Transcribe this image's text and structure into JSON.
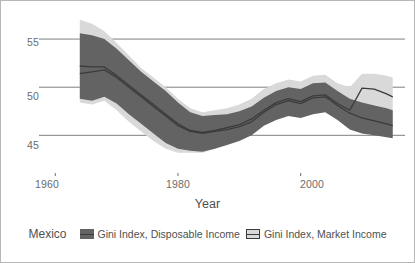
{
  "chart_data": {
    "type": "area",
    "title": "",
    "subtitle": "",
    "xlabel": "Year",
    "ylabel": "",
    "xlim": [
      1958,
      2017
    ],
    "ylim": [
      41.5,
      57.5
    ],
    "xticks": [
      1960,
      1980,
      2000
    ],
    "xtick_labels": [
      "1960",
      "1980",
      "2000"
    ],
    "yticks": [
      45,
      50,
      55
    ],
    "ytick_labels": [
      "45",
      "50",
      "55"
    ],
    "grid": "horizontal",
    "legend_position": "bottom",
    "group_label": "Mexico",
    "colors": {
      "disposable_band": "#636363",
      "disposable_line": "#3b3b3b",
      "market_band": "#d9d9d9",
      "market_line": "#3b3b3b",
      "gridline": "#6f7173",
      "border": "#b5b7b9",
      "text": "#4e5052",
      "tick_text": "#6a6c6e",
      "background": "#ffffff"
    },
    "x": [
      1964,
      1966,
      1968,
      1970,
      1972,
      1974,
      1976,
      1978,
      1980,
      1982,
      1984,
      1986,
      1988,
      1990,
      1992,
      1994,
      1996,
      1998,
      2000,
      2002,
      2004,
      2006,
      2008,
      2010,
      2012,
      2014,
      2015
    ],
    "series": [
      {
        "name": "Gini Index, Disposable Income",
        "style": "filled-band",
        "values": [
          51.4,
          51.6,
          51.8,
          51.0,
          50.0,
          49.0,
          48.0,
          47.0,
          46.0,
          45.4,
          45.2,
          45.4,
          45.6,
          45.9,
          46.4,
          47.4,
          48.2,
          48.6,
          48.3,
          48.9,
          49.0,
          48.1,
          47.3,
          46.8,
          46.5,
          46.2,
          46.0
        ],
        "lower": [
          48.8,
          48.6,
          49.0,
          48.3,
          47.2,
          46.2,
          45.2,
          44.2,
          43.6,
          43.4,
          43.3,
          43.6,
          44.0,
          44.4,
          45.0,
          46.0,
          46.6,
          47.0,
          46.8,
          47.2,
          47.4,
          46.6,
          45.6,
          45.2,
          45.0,
          44.8,
          44.7
        ],
        "upper": [
          55.6,
          55.4,
          55.0,
          54.0,
          52.8,
          51.6,
          50.6,
          49.6,
          48.4,
          47.4,
          47.0,
          47.1,
          47.2,
          47.5,
          48.0,
          48.9,
          49.6,
          50.0,
          49.8,
          50.4,
          50.5,
          49.6,
          48.8,
          48.4,
          48.1,
          47.8,
          47.6
        ]
      },
      {
        "name": "Gini Index, Market Income",
        "style": "outlined-band",
        "values": [
          52.2,
          52.1,
          52.1,
          51.2,
          50.2,
          49.2,
          48.2,
          47.2,
          46.2,
          45.5,
          45.3,
          45.5,
          45.8,
          46.1,
          46.7,
          47.6,
          48.4,
          48.8,
          48.5,
          49.1,
          49.2,
          48.3,
          47.6,
          49.9,
          49.8,
          49.3,
          49.0
        ],
        "lower": [
          48.4,
          48.2,
          48.6,
          47.6,
          46.4,
          45.4,
          44.4,
          43.6,
          43.2,
          43.2,
          43.2,
          43.6,
          44.2,
          44.8,
          45.6,
          46.6,
          47.2,
          47.5,
          47.2,
          47.6,
          47.8,
          46.9,
          46.0,
          47.4,
          47.2,
          46.6,
          45.2
        ],
        "upper": [
          57.0,
          56.6,
          55.8,
          54.6,
          53.3,
          52.0,
          51.0,
          50.0,
          48.8,
          47.8,
          47.4,
          47.6,
          47.8,
          48.2,
          48.8,
          49.8,
          50.4,
          50.8,
          50.6,
          51.2,
          51.3,
          50.4,
          50.0,
          51.4,
          51.4,
          51.2,
          51.0
        ]
      }
    ]
  }
}
